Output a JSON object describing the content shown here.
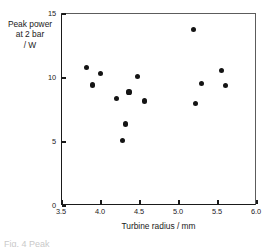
{
  "figure": {
    "caption_fragment": "Fig. 4 Peak"
  },
  "axes": {
    "x": {
      "title": "Turbine radius / mm",
      "ticks": [
        "3.5",
        "4.0",
        "4.5",
        "5.0",
        "5.5",
        "6.0"
      ],
      "tick_values": [
        3.5,
        4.0,
        4.5,
        5.0,
        5.5,
        6.0
      ],
      "min": 3.5,
      "max": 6.0
    },
    "y": {
      "title_lines": [
        "Peak power",
        "at 2 bar",
        "/ W"
      ],
      "ticks": [
        "0",
        "5",
        "10",
        "15"
      ],
      "tick_values": [
        0,
        5,
        10,
        15
      ],
      "min": 0,
      "max": 15
    }
  },
  "chart_data": {
    "type": "scatter",
    "title": "",
    "subtitle": "",
    "xlabel": "Turbine radius / mm",
    "ylabel": "Peak power at 2 bar / W",
    "xlim": [
      3.5,
      6.0
    ],
    "ylim": [
      0,
      15
    ],
    "xticks": [
      3.5,
      4.0,
      4.5,
      5.0,
      5.5,
      6.0
    ],
    "yticks": [
      0,
      5,
      10,
      15
    ],
    "grid": false,
    "legend": null,
    "marker": "filled-circle",
    "marker_color": "#141414",
    "series": [
      {
        "name": "Peak power",
        "points": [
          {
            "x": 3.81,
            "y": 10.8
          },
          {
            "x": 3.89,
            "y": 9.45
          },
          {
            "x": 3.99,
            "y": 10.35
          },
          {
            "x": 4.2,
            "y": 8.4
          },
          {
            "x": 4.28,
            "y": 5.1
          },
          {
            "x": 4.31,
            "y": 6.4
          },
          {
            "x": 4.36,
            "y": 8.9
          },
          {
            "x": 4.47,
            "y": 10.1
          },
          {
            "x": 4.56,
            "y": 8.2
          },
          {
            "x": 5.19,
            "y": 13.8
          },
          {
            "x": 5.21,
            "y": 8.0
          },
          {
            "x": 5.29,
            "y": 9.6
          },
          {
            "x": 5.55,
            "y": 10.6
          },
          {
            "x": 5.6,
            "y": 9.4
          }
        ]
      }
    ]
  }
}
